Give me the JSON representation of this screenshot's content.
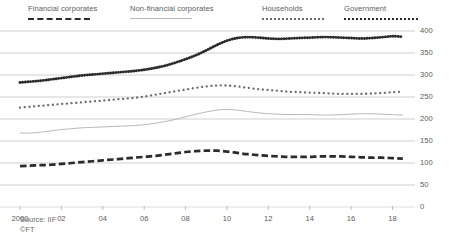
{
  "legend": {
    "items": [
      {
        "label": "Financial corporates",
        "style": "dashed-thick",
        "color": "#2b2b2b",
        "x": 28,
        "width": 110
      },
      {
        "label": "Non-financial corporates",
        "style": "solid-thin",
        "color": "#b9b9b9",
        "x": 130,
        "width": 130
      },
      {
        "label": "Households",
        "style": "dotted-sparse",
        "color": "#6e6e6e",
        "x": 262,
        "width": 80
      },
      {
        "label": "Government",
        "style": "dotted-dense",
        "color": "#2b2b2b",
        "x": 344,
        "width": 90
      }
    ]
  },
  "footer": {
    "source": "Source: IIF",
    "copyright": "©FT"
  },
  "chart_data": {
    "type": "line",
    "title": "",
    "subtitle": "",
    "xlabel": "",
    "ylabel": "",
    "grid": true,
    "legend_position": "top",
    "xlim": [
      2000,
      2018.75
    ],
    "ylim": [
      0,
      400
    ],
    "yticks": [
      0,
      50,
      100,
      150,
      200,
      250,
      300,
      350,
      400
    ],
    "xticks": [
      2000,
      2002,
      2004,
      2006,
      2008,
      2010,
      2012,
      2014,
      2016,
      2018
    ],
    "xticklabels": [
      "2000",
      "02",
      "04",
      "06",
      "08",
      "10",
      "12",
      "14",
      "16",
      "18"
    ],
    "x": [
      2000,
      2000.5,
      2001,
      2001.5,
      2002,
      2002.5,
      2003,
      2003.5,
      2004,
      2004.5,
      2005,
      2005.5,
      2006,
      2006.5,
      2007,
      2007.5,
      2008,
      2008.5,
      2009,
      2009.5,
      2010,
      2010.5,
      2011,
      2011.5,
      2012,
      2012.5,
      2013,
      2013.5,
      2014,
      2014.5,
      2015,
      2015.5,
      2016,
      2016.5,
      2017,
      2017.5,
      2018,
      2018.5
    ],
    "series": [
      {
        "name": "Government",
        "style": "dotted-dense",
        "color": "#2b2b2b",
        "values": [
          283,
          285,
          287,
          290,
          293,
          296,
          299,
          301,
          303,
          305,
          307,
          309,
          312,
          316,
          321,
          328,
          336,
          345,
          356,
          368,
          378,
          384,
          386,
          385,
          383,
          382,
          383,
          384,
          385,
          386,
          386,
          385,
          384,
          383,
          384,
          386,
          388,
          387
        ]
      },
      {
        "name": "Households",
        "style": "dotted-sparse",
        "color": "#6e6e6e",
        "values": [
          226,
          228,
          230,
          232,
          234,
          236,
          238,
          240,
          242,
          244,
          246,
          248,
          251,
          255,
          259,
          263,
          267,
          271,
          274,
          276,
          276,
          274,
          271,
          268,
          266,
          264,
          262,
          261,
          260,
          259,
          258,
          257,
          257,
          257,
          258,
          259,
          261,
          262
        ]
      },
      {
        "name": "Non-financial corporates",
        "style": "solid-thin",
        "color": "#b9b9b9",
        "values": [
          168,
          168,
          170,
          173,
          176,
          178,
          180,
          181,
          182,
          183,
          184,
          185,
          187,
          190,
          194,
          199,
          205,
          211,
          216,
          220,
          222,
          220,
          217,
          214,
          212,
          211,
          210,
          210,
          210,
          209,
          209,
          210,
          211,
          212,
          212,
          211,
          210,
          209
        ]
      },
      {
        "name": "Financial corporates",
        "style": "dashed-thick",
        "color": "#2b2b2b",
        "values": [
          93,
          94,
          95,
          96,
          98,
          100,
          102,
          104,
          106,
          108,
          110,
          112,
          114,
          116,
          119,
          122,
          125,
          127,
          128,
          128,
          126,
          123,
          120,
          118,
          116,
          115,
          114,
          114,
          114,
          115,
          115,
          115,
          114,
          113,
          112,
          112,
          111,
          110
        ]
      }
    ]
  }
}
